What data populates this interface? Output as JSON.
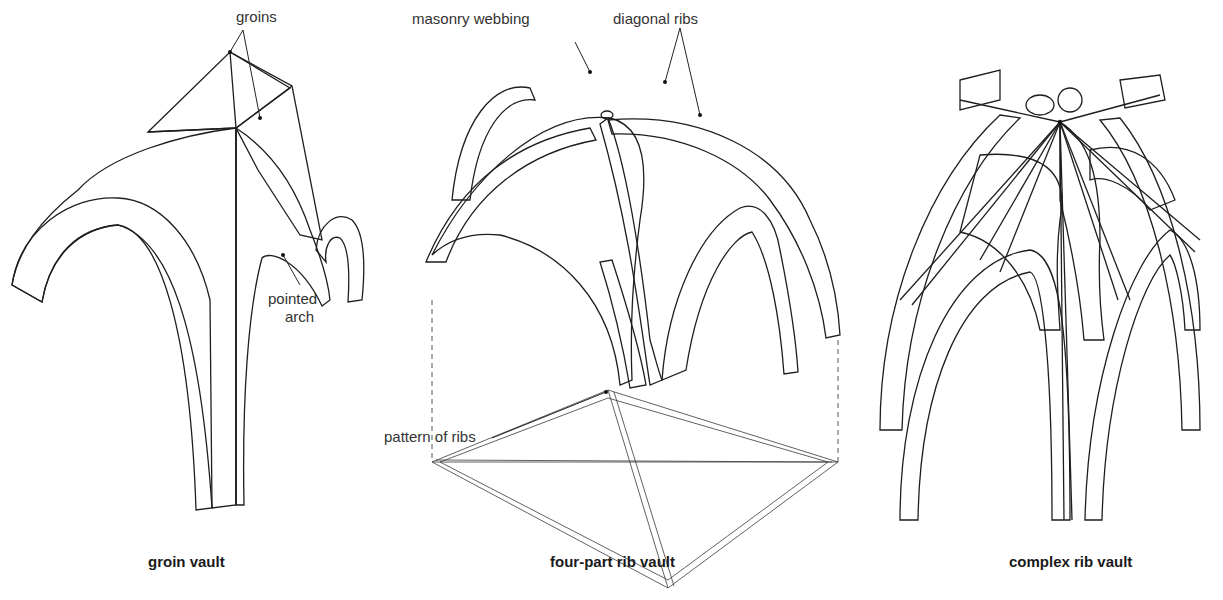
{
  "figure": {
    "panels": [
      {
        "id": "groin",
        "caption": "groin vault",
        "labels": {
          "groins": "groins",
          "pointed_arch_line1": "pointed",
          "pointed_arch_line2": "arch"
        }
      },
      {
        "id": "four-part",
        "caption": "four-part rib vault",
        "labels": {
          "masonry_webbing": "masonry webbing",
          "diagonal_ribs": "diagonal ribs",
          "pattern_of_ribs": "pattern of ribs"
        }
      },
      {
        "id": "complex",
        "caption": "complex rib vault",
        "labels": {}
      }
    ]
  },
  "colors": {
    "masonry_fill": "#e6e6e6",
    "outline": "#1e1e1e",
    "label_text": "#333333",
    "caption_text": "#1a1a1a",
    "background": "#ffffff"
  }
}
